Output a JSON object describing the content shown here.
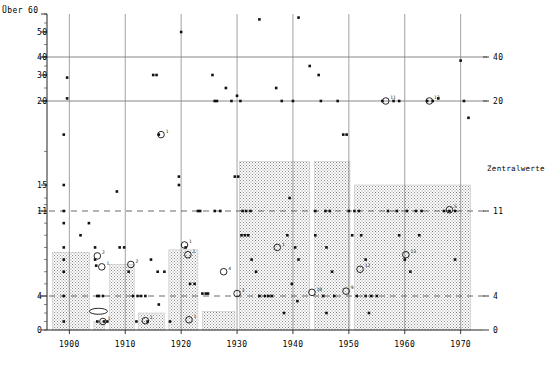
{
  "chart_data": {
    "type": "scatter",
    "title": "",
    "xlabel": "",
    "ylabel": "",
    "corner_label": "Über 60",
    "median_series_label": "Zentralwerte",
    "xlim": [
      1896,
      1974
    ],
    "x_ticks": [
      1900,
      1910,
      1920,
      1930,
      1940,
      1950,
      1960,
      1970
    ],
    "y_ticks_left": [
      "Über 60",
      "50",
      "40",
      "30",
      "20",
      "15",
      "11",
      "4",
      "0"
    ],
    "y_ticks_right": [
      "40",
      "20",
      "11",
      "4",
      "0"
    ],
    "y_tick_values": [
      60,
      50,
      40,
      30,
      20,
      15,
      11,
      4,
      0
    ],
    "grid": {
      "solid_horizontal": [
        40,
        20
      ],
      "dashed_horizontal": [
        11,
        4
      ],
      "vertical_decades": [
        1900,
        1910,
        1920,
        1930,
        1940,
        1950,
        1960,
        1970
      ]
    },
    "median_steps": [
      {
        "x0": 1897.0,
        "x1": 1903.6,
        "value": 7.6
      },
      {
        "x0": 1904.4,
        "x1": 1906.3,
        "value": 1.0
      },
      {
        "x0": 1907.2,
        "x1": 1911.6,
        "value": 6.6
      },
      {
        "x0": 1912.4,
        "x1": 1917.0,
        "value": 2.0
      },
      {
        "x0": 1917.8,
        "x1": 1923.0,
        "value": 7.8
      },
      {
        "x0": 1923.8,
        "x1": 1929.6,
        "value": 2.2
      },
      {
        "x0": 1930.4,
        "x1": 1943.0,
        "value": 16.4
      },
      {
        "x0": 1943.8,
        "x1": 1950.2,
        "value": 16.4
      },
      {
        "x0": 1951.0,
        "x1": 1971.8,
        "value": 15.0
      }
    ],
    "points": [
      {
        "x": 1899.6,
        "y": 29
      },
      {
        "x": 1899.6,
        "y": 21
      },
      {
        "x": 1899.0,
        "y": 18
      },
      {
        "x": 1899.0,
        "y": 15
      },
      {
        "x": 1899.0,
        "y": 11
      },
      {
        "x": 1899.0,
        "y": 10
      },
      {
        "x": 1899.0,
        "y": 8
      },
      {
        "x": 1899.0,
        "y": 7
      },
      {
        "x": 1899.0,
        "y": 6
      },
      {
        "x": 1899.0,
        "y": 4
      },
      {
        "x": 1899.0,
        "y": 1
      },
      {
        "x": 1902.0,
        "y": 9
      },
      {
        "x": 1903.5,
        "y": 10
      },
      {
        "x": 1904.6,
        "y": 8
      },
      {
        "x": 1904.6,
        "y": 7
      },
      {
        "x": 1904.8,
        "y": 6.5
      },
      {
        "x": 1905.0,
        "y": 4
      },
      {
        "x": 1905.3,
        "y": 4
      },
      {
        "x": 1906.0,
        "y": 4
      },
      {
        "x": 1905.0,
        "y": 1
      },
      {
        "x": 1906.2,
        "y": 1
      },
      {
        "x": 1906.8,
        "y": 1
      },
      {
        "x": 1908.5,
        "y": 14
      },
      {
        "x": 1909.0,
        "y": 8
      },
      {
        "x": 1909.8,
        "y": 8
      },
      {
        "x": 1910.6,
        "y": 6
      },
      {
        "x": 1911.4,
        "y": 4
      },
      {
        "x": 1912.2,
        "y": 4
      },
      {
        "x": 1912.8,
        "y": 4
      },
      {
        "x": 1913.6,
        "y": 4
      },
      {
        "x": 1912.0,
        "y": 1
      },
      {
        "x": 1914.0,
        "y": 1
      },
      {
        "x": 1915.0,
        "y": 30
      },
      {
        "x": 1915.6,
        "y": 30
      },
      {
        "x": 1916.0,
        "y": 18
      },
      {
        "x": 1914.6,
        "y": 7
      },
      {
        "x": 1915.8,
        "y": 6
      },
      {
        "x": 1917.0,
        "y": 6
      },
      {
        "x": 1916.0,
        "y": 3
      },
      {
        "x": 1918.0,
        "y": 1
      },
      {
        "x": 1920.0,
        "y": 50
      },
      {
        "x": 1919.6,
        "y": 15
      },
      {
        "x": 1919.6,
        "y": 15.5
      },
      {
        "x": 1920.8,
        "y": 8
      },
      {
        "x": 1921.6,
        "y": 5
      },
      {
        "x": 1922.4,
        "y": 5
      },
      {
        "x": 1923.0,
        "y": 11
      },
      {
        "x": 1923.4,
        "y": 11
      },
      {
        "x": 1923.8,
        "y": 4.2
      },
      {
        "x": 1924.4,
        "y": 4.2
      },
      {
        "x": 1924.8,
        "y": 4.2
      },
      {
        "x": 1925.6,
        "y": 30
      },
      {
        "x": 1926.0,
        "y": 20
      },
      {
        "x": 1926.4,
        "y": 20
      },
      {
        "x": 1926.0,
        "y": 11
      },
      {
        "x": 1927.0,
        "y": 11
      },
      {
        "x": 1928.0,
        "y": 25
      },
      {
        "x": 1929.0,
        "y": 20
      },
      {
        "x": 1930.0,
        "y": 22
      },
      {
        "x": 1930.6,
        "y": 20
      },
      {
        "x": 1929.6,
        "y": 15.5
      },
      {
        "x": 1930.2,
        "y": 15.5
      },
      {
        "x": 1931.0,
        "y": 11
      },
      {
        "x": 1931.6,
        "y": 11
      },
      {
        "x": 1932.4,
        "y": 11
      },
      {
        "x": 1930.8,
        "y": 9
      },
      {
        "x": 1931.4,
        "y": 9
      },
      {
        "x": 1932.0,
        "y": 9
      },
      {
        "x": 1932.6,
        "y": 7
      },
      {
        "x": 1933.4,
        "y": 6
      },
      {
        "x": 1934.0,
        "y": 4
      },
      {
        "x": 1935.0,
        "y": 4
      },
      {
        "x": 1935.6,
        "y": 4
      },
      {
        "x": 1936.2,
        "y": 4
      },
      {
        "x": 1934.0,
        "y": 57
      },
      {
        "x": 1937.0,
        "y": 25
      },
      {
        "x": 1938.0,
        "y": 20
      },
      {
        "x": 1941.0,
        "y": 58
      },
      {
        "x": 1940.0,
        "y": 20
      },
      {
        "x": 1939.4,
        "y": 13
      },
      {
        "x": 1939.0,
        "y": 9
      },
      {
        "x": 1940.4,
        "y": 8
      },
      {
        "x": 1941.0,
        "y": 7
      },
      {
        "x": 1939.8,
        "y": 5
      },
      {
        "x": 1940.8,
        "y": 3.4
      },
      {
        "x": 1938.4,
        "y": 2
      },
      {
        "x": 1943.0,
        "y": 35
      },
      {
        "x": 1944.6,
        "y": 30
      },
      {
        "x": 1945.0,
        "y": 20
      },
      {
        "x": 1944.0,
        "y": 11
      },
      {
        "x": 1945.8,
        "y": 11
      },
      {
        "x": 1946.6,
        "y": 11
      },
      {
        "x": 1944.0,
        "y": 9
      },
      {
        "x": 1946.0,
        "y": 8
      },
      {
        "x": 1947.0,
        "y": 6
      },
      {
        "x": 1945.4,
        "y": 4
      },
      {
        "x": 1947.4,
        "y": 4
      },
      {
        "x": 1946.0,
        "y": 2
      },
      {
        "x": 1948.0,
        "y": 20
      },
      {
        "x": 1949.0,
        "y": 18
      },
      {
        "x": 1949.6,
        "y": 18
      },
      {
        "x": 1950.0,
        "y": 11
      },
      {
        "x": 1951.0,
        "y": 11
      },
      {
        "x": 1951.8,
        "y": 11
      },
      {
        "x": 1950.6,
        "y": 9
      },
      {
        "x": 1952.2,
        "y": 9
      },
      {
        "x": 1953.0,
        "y": 7
      },
      {
        "x": 1951.4,
        "y": 4
      },
      {
        "x": 1953.0,
        "y": 4
      },
      {
        "x": 1954.0,
        "y": 4
      },
      {
        "x": 1955.0,
        "y": 4
      },
      {
        "x": 1953.6,
        "y": 2
      },
      {
        "x": 1956.0,
        "y": 20
      },
      {
        "x": 1958.0,
        "y": 20
      },
      {
        "x": 1959.0,
        "y": 20
      },
      {
        "x": 1957.0,
        "y": 11
      },
      {
        "x": 1958.6,
        "y": 11
      },
      {
        "x": 1960.4,
        "y": 11
      },
      {
        "x": 1959.0,
        "y": 9
      },
      {
        "x": 1960.0,
        "y": 7
      },
      {
        "x": 1961.0,
        "y": 6
      },
      {
        "x": 1962.0,
        "y": 11
      },
      {
        "x": 1963.0,
        "y": 11
      },
      {
        "x": 1964.0,
        "y": 20
      },
      {
        "x": 1965.0,
        "y": 20
      },
      {
        "x": 1966.0,
        "y": 21
      },
      {
        "x": 1967.0,
        "y": 11
      },
      {
        "x": 1968.0,
        "y": 11
      },
      {
        "x": 1969.0,
        "y": 11
      },
      {
        "x": 1970.0,
        "y": 38
      },
      {
        "x": 1970.6,
        "y": 20
      },
      {
        "x": 1971.4,
        "y": 19
      },
      {
        "x": 1969.0,
        "y": 7
      },
      {
        "x": 1962.6,
        "y": 9
      }
    ],
    "circle_markers": [
      {
        "x": 1905.0,
        "y": 7.3,
        "label": "2"
      },
      {
        "x": 1905.8,
        "y": 6.4,
        "label": "1"
      },
      {
        "x": 1906.0,
        "y": 1.0,
        "label": "1"
      },
      {
        "x": 1911.0,
        "y": 6.6,
        "label": "2"
      },
      {
        "x": 1913.6,
        "y": 1.1,
        "label": "1"
      },
      {
        "x": 1916.4,
        "y": 18.0,
        "label": "1"
      },
      {
        "x": 1920.6,
        "y": 8.2,
        "label": "1"
      },
      {
        "x": 1921.2,
        "y": 7.4,
        "label": "1"
      },
      {
        "x": 1921.4,
        "y": 1.2,
        "label": "1"
      },
      {
        "x": 1927.6,
        "y": 6.0,
        "label": "4"
      },
      {
        "x": 1937.2,
        "y": 8.0,
        "label": "1"
      },
      {
        "x": 1930.0,
        "y": 4.2,
        "label": "3"
      },
      {
        "x": 1943.4,
        "y": 4.3,
        "label": "10"
      },
      {
        "x": 1949.5,
        "y": 4.4,
        "label": "9"
      },
      {
        "x": 1952.0,
        "y": 6.2,
        "label": "12"
      },
      {
        "x": 1956.6,
        "y": 20.0,
        "label": "11"
      },
      {
        "x": 1964.4,
        "y": 20.0,
        "label": "13"
      },
      {
        "x": 1960.2,
        "y": 7.4,
        "label": "13"
      },
      {
        "x": 1968.0,
        "y": 11.2,
        "label": "5"
      }
    ],
    "ellipse_marker": {
      "x": 1905.2,
      "y": 2.2
    }
  }
}
